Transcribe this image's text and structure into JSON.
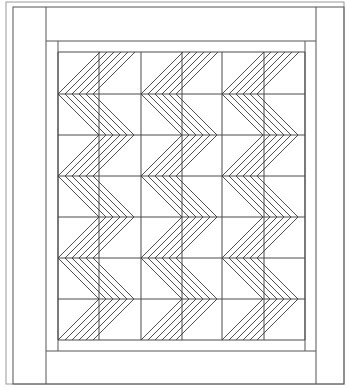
{
  "diagram": {
    "colors": {
      "line": "#4a4a4a",
      "outer_line": "#9a9a9a",
      "background": "#ffffff"
    },
    "layout": {
      "outer_frame": {
        "x": 6,
        "y": 2,
        "w": 338,
        "h": 382
      },
      "inner_frame": {
        "x": 13,
        "y": 7,
        "w": 331,
        "h": 377
      },
      "side_border_x": [
        46,
        316
      ],
      "top_border_y": 41,
      "bottom_border_y": 351,
      "panel": {
        "x": 58,
        "y": 52,
        "w": 247,
        "h": 288
      },
      "panel_side_x": [
        58,
        305
      ],
      "columns": 6,
      "rows": 7,
      "column_lines_x": [
        58,
        99,
        141,
        182,
        222,
        264,
        305
      ],
      "row_lines_y": [
        52,
        94,
        135,
        176,
        217,
        258,
        299,
        340
      ],
      "bands": [
        {
          "x0": 58,
          "x1": 141
        },
        {
          "x0": 141,
          "x1": 222
        },
        {
          "x0": 222,
          "x1": 305
        }
      ],
      "lines_per_chevron": 6,
      "line_spacing": 7
    }
  }
}
